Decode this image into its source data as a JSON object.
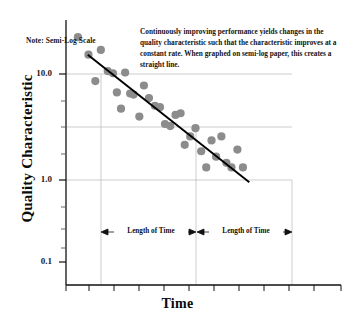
{
  "figure": {
    "note": "Note: Semi-Log Scale",
    "annotation": "Continuously improving performance yields changes in the quality characteristic such that the characteristic improves at a constant rate.  When graphed on semi-log paper, this creates a straight line.",
    "span_label_left": "Length of Time",
    "span_label_right": "Length of Time"
  },
  "chart_data": {
    "type": "scatter",
    "title": "",
    "xlabel": "Time",
    "ylabel": "Quality Characteristic",
    "yscale": "log",
    "ylim": [
      0.1,
      20
    ],
    "ytick_labels": [
      "10.0",
      "1.0",
      "0.1"
    ],
    "ytick_values": [
      10.0,
      1.0,
      0.1
    ],
    "xlim": [
      0,
      12
    ],
    "xtick_labels": [
      "",
      "",
      "",
      "",
      "",
      "",
      "",
      "",
      "",
      "",
      "",
      ""
    ],
    "grid": true,
    "gridlines_y": [
      10.0,
      3.0,
      1.0
    ],
    "legend": "none",
    "series": [
      {
        "name": "Quality Characteristic observations",
        "marker": "circle",
        "color": "#8c8c8c",
        "points": [
          {
            "x": 0.52,
            "y": 14.2
          },
          {
            "x": 0.98,
            "y": 10.0
          },
          {
            "x": 1.28,
            "y": 5.9
          },
          {
            "x": 1.52,
            "y": 11.0
          },
          {
            "x": 1.82,
            "y": 7.2
          },
          {
            "x": 2.05,
            "y": 6.9
          },
          {
            "x": 2.22,
            "y": 4.7
          },
          {
            "x": 2.4,
            "y": 3.4
          },
          {
            "x": 2.58,
            "y": 7.0
          },
          {
            "x": 2.8,
            "y": 4.6
          },
          {
            "x": 2.95,
            "y": 4.5
          },
          {
            "x": 3.2,
            "y": 2.9
          },
          {
            "x": 3.4,
            "y": 5.4
          },
          {
            "x": 3.62,
            "y": 4.2
          },
          {
            "x": 3.88,
            "y": 3.6
          },
          {
            "x": 4.1,
            "y": 3.5
          },
          {
            "x": 4.32,
            "y": 2.5
          },
          {
            "x": 4.55,
            "y": 2.4
          },
          {
            "x": 4.78,
            "y": 3.0
          },
          {
            "x": 5.0,
            "y": 3.1
          },
          {
            "x": 5.18,
            "y": 1.65
          },
          {
            "x": 5.42,
            "y": 1.95
          },
          {
            "x": 5.65,
            "y": 2.3
          },
          {
            "x": 5.9,
            "y": 1.45
          },
          {
            "x": 6.12,
            "y": 1.05
          },
          {
            "x": 6.35,
            "y": 1.8
          },
          {
            "x": 6.55,
            "y": 1.3
          },
          {
            "x": 6.78,
            "y": 1.95
          },
          {
            "x": 7.0,
            "y": 1.15
          },
          {
            "x": 7.22,
            "y": 1.05
          },
          {
            "x": 7.48,
            "y": 1.5
          },
          {
            "x": 7.72,
            "y": 1.05
          }
        ]
      }
    ],
    "trendline": {
      "name": "fitted constant-rate line",
      "color": "#000000",
      "x_start": 0.95,
      "y_start": 10.0,
      "x_end": 8.0,
      "y_end": 0.78
    },
    "span_annotations": [
      {
        "label": "Length of Time",
        "x_start": 0.95,
        "x_end": 4.95
      },
      {
        "label": "Length of Time",
        "x_start": 4.95,
        "x_end": 9.0
      }
    ],
    "drop_lines_x": [
      0.95,
      4.95,
      9.0
    ]
  }
}
